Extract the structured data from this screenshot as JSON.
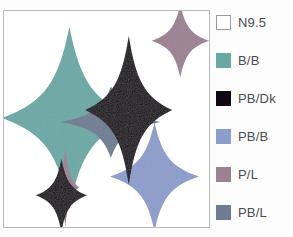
{
  "figure": {
    "title": "",
    "panel_background": "#ffffff",
    "panel_border_color": "#b9b9bb",
    "page_background": "#fdfdfd"
  },
  "legend": {
    "position": "right",
    "items": [
      {
        "label": "N9.5",
        "color": "#ffffff",
        "swatch_name": "legend-swatch-n95"
      },
      {
        "label": "B/B",
        "color": "#6aa8a4",
        "swatch_name": "legend-swatch-b-b"
      },
      {
        "label": "PB/Dk",
        "color": "#100714",
        "swatch_name": "legend-swatch-pb-dk"
      },
      {
        "label": "PB/B",
        "color": "#8c9ccb",
        "swatch_name": "legend-swatch-pb-b"
      },
      {
        "label": "P/L",
        "color": "#9c8193",
        "swatch_name": "legend-swatch-p-l"
      },
      {
        "label": "PB/L",
        "color": "#6f7b92",
        "swatch_name": "legend-swatch-pb-l"
      }
    ]
  },
  "chart_data": {
    "type": "scatter",
    "title": "",
    "xlabel": "",
    "ylabel": "",
    "xlim": [
      0,
      207
    ],
    "ylim": [
      0,
      218
    ],
    "grid": false,
    "shape": "four-pointed-star",
    "series": [
      {
        "name": "B/B",
        "color": "#6aa8a4",
        "points": [
          {
            "cx": 66,
            "cy": 108,
            "rx": 68,
            "ry": 92,
            "z": 2
          }
        ]
      },
      {
        "name": "PB/L",
        "color": "#6f7b92",
        "points": [
          {
            "cx": 108,
            "cy": 112,
            "rx": 50,
            "ry": 36,
            "z": 3
          }
        ]
      },
      {
        "name": "PB/Dk",
        "color": "#100714",
        "points": [
          {
            "cx": 126,
            "cy": 100,
            "rx": 44,
            "ry": 75,
            "z": 4
          },
          {
            "cx": 58,
            "cy": 186,
            "rx": 26,
            "ry": 37,
            "z": 5
          }
        ]
      },
      {
        "name": "P/L",
        "color": "#9c8193",
        "points": [
          {
            "cx": 178,
            "cy": 30,
            "rx": 29,
            "ry": 37,
            "z": 2
          },
          {
            "cx": 62,
            "cy": 178,
            "rx": 14,
            "ry": 40,
            "z": 4
          }
        ]
      },
      {
        "name": "PB/B",
        "color": "#8c9ccb",
        "points": [
          {
            "cx": 152,
            "cy": 167,
            "rx": 45,
            "ry": 55,
            "z": 2
          }
        ]
      }
    ]
  }
}
